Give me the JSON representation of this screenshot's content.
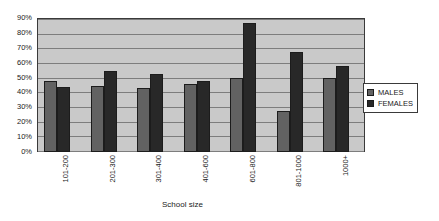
{
  "chart_data": {
    "type": "bar",
    "title": "",
    "xlabel": "School size",
    "ylabel": "",
    "categories": [
      "101-200",
      "201-300",
      "301-400",
      "401-600",
      "601-800",
      "801-1000",
      "1000+"
    ],
    "series": [
      {
        "name": "MALES",
        "color": "#626262",
        "values": [
          48,
          45,
          43,
          46,
          50,
          28,
          50
        ]
      },
      {
        "name": "FEMALES",
        "color": "#282828",
        "values": [
          44,
          55,
          53,
          48,
          87,
          68,
          58
        ]
      }
    ],
    "ylim": [
      0,
      90
    ],
    "ytick_values": [
      0,
      10,
      20,
      30,
      40,
      50,
      60,
      70,
      80,
      90
    ],
    "ytick_labels": [
      "0%",
      "10%",
      "20%",
      "30%",
      "40%",
      "50%",
      "60%",
      "70%",
      "80%",
      "90%"
    ],
    "grid": true,
    "legend_position": "right",
    "plot_background": "#c9c9c9",
    "page_background": "#ffffff"
  }
}
